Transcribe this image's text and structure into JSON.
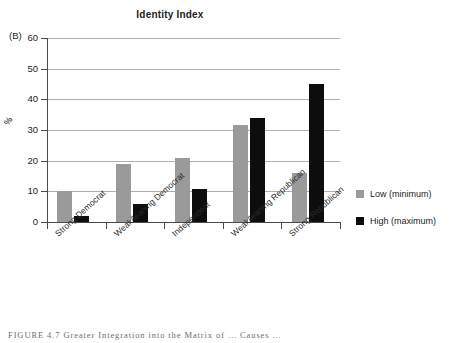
{
  "figure": {
    "panel_label": "(B)",
    "caption": "FIGURE 4.7  Greater Integration into the Matrix of ... Causes ...",
    "caption_prefix": "FIGURE 4.7"
  },
  "legend": {
    "position": "right",
    "items": [
      {
        "label": "Low (minimum)",
        "color": "#9a9a9a",
        "swatch_name": "legend-swatch-low"
      },
      {
        "label": "High (maximum)",
        "color": "#0d0d0d",
        "swatch_name": "legend-swatch-high"
      }
    ]
  },
  "chart_data": {
    "type": "bar",
    "title": "Identity Index",
    "xlabel": "",
    "ylabel": "%",
    "ylim": [
      0,
      60
    ],
    "yticks": [
      0,
      10,
      20,
      30,
      40,
      50,
      60
    ],
    "grid": true,
    "legend_position": "right",
    "categories": [
      "Strong Democrat",
      "Weak/leaning Democrat",
      "Independent",
      "Weak/leaning Republican",
      "Strong Republican"
    ],
    "series": [
      {
        "name": "Low (minimum)",
        "color": "#9a9a9a",
        "values": [
          10,
          19,
          21,
          31.5,
          16
        ]
      },
      {
        "name": "High (maximum)",
        "color": "#0d0d0d",
        "values": [
          2,
          6,
          10.7,
          34,
          45
        ]
      }
    ]
  }
}
